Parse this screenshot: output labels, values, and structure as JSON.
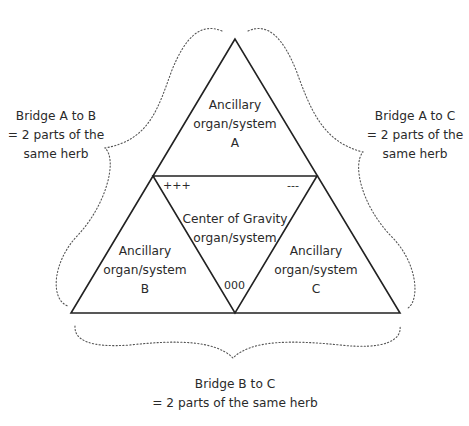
{
  "diagram": {
    "type": "triangle-of-organ-systems",
    "top_triangle": {
      "line1": "Ancillary",
      "line2": "organ/system",
      "line3": "A"
    },
    "center_triangle": {
      "line1": "Center of Gravity",
      "line2": "organ/system"
    },
    "left_triangle": {
      "line1": "Ancillary",
      "line2": "organ/system",
      "line3": "B"
    },
    "right_triangle": {
      "line1": "Ancillary",
      "line2": "organ/system",
      "line3": "C"
    },
    "markers": {
      "top_left": "+++",
      "top_right": "---",
      "bottom": "000"
    },
    "bridges": {
      "a_to_b": {
        "line1": "Bridge A to B",
        "line2": "= 2 parts of the",
        "line3": "same herb"
      },
      "a_to_c": {
        "line1": "Bridge A to C",
        "line2": "= 2 parts of the",
        "line3": "same herb"
      },
      "b_to_c": {
        "line1": "Bridge B to C",
        "line2": "= 2 parts of the same herb"
      }
    },
    "colors": {
      "line": "#222222",
      "dotted": "#555555",
      "text": "#2a2a2a",
      "background": "#ffffff"
    }
  }
}
